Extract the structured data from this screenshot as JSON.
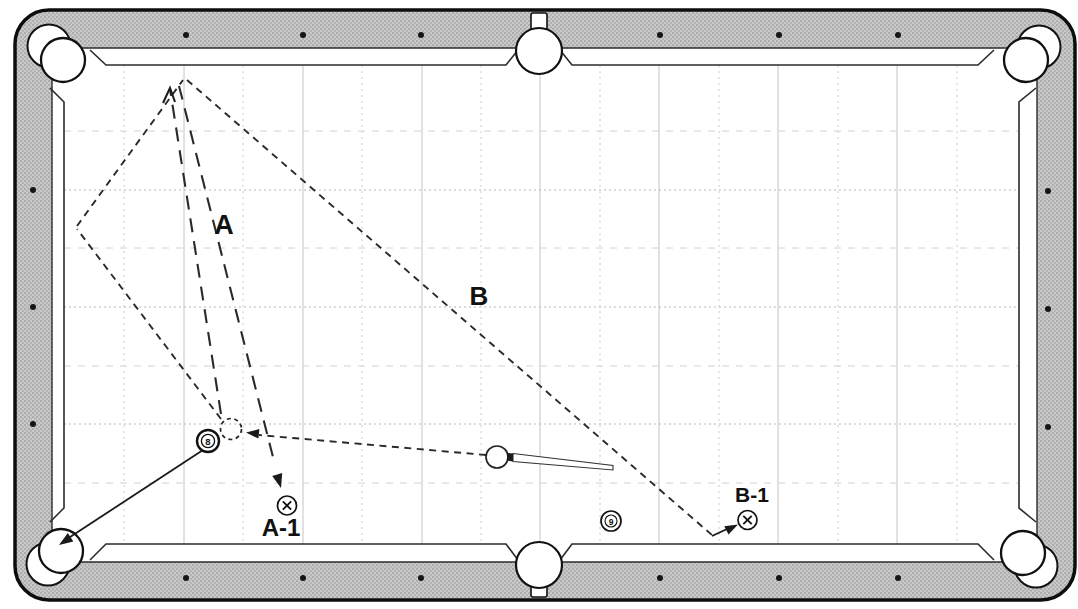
{
  "figure_title": "pool-table-bank-shot-position-diagram",
  "colors": {
    "rail_gray": "#c9c9c9",
    "rail_stipple_dot": "#7d7d7d",
    "frame_outline": "#0d0d0d",
    "cushion_line": "#2b2b2b",
    "grid_major": "#c4c4c4",
    "grid_minor": "#d4d4d4",
    "path_ink": "#2a2a2a",
    "field": "#ffffff"
  },
  "summary": {
    "paths": [
      {
        "label": "A",
        "style": "long-dash",
        "meaning": "cue ball to top cushion and back to position A-1"
      },
      {
        "label": "B",
        "style": "short-dash",
        "meaning": "cue ball two rails (left cushion, top cushion) down table to position B-1"
      }
    ],
    "balls": [
      "8",
      "9",
      "cue"
    ],
    "position_markers": [
      "A-1",
      "B-1"
    ]
  },
  "figure": {
    "width": 1078,
    "height": 609,
    "layers": [
      {
        "t": "rect",
        "n": "table-frame",
        "x": 15,
        "y": 10,
        "w": 1060,
        "h": 590,
        "rx": 34,
        "fill": "url(#stipple)",
        "stroke": "#0d0d0d",
        "sw": 3.5
      },
      {
        "t": "rect",
        "n": "cushion-band",
        "x": 52,
        "y": 48,
        "w": 985,
        "h": 514,
        "rx": 6,
        "fill": "#ffffff",
        "stroke": "#2b2b2b",
        "sw": 1.4
      },
      {
        "t": "vlines",
        "n": "grid-vertical-major",
        "xs": [
          184,
          303,
          422,
          540,
          659,
          778,
          897
        ],
        "y1": 65,
        "y2": 544,
        "stroke": "#c4c4c4",
        "sw": 1
      },
      {
        "t": "vlines",
        "n": "grid-vertical-minor",
        "xs": [
          124,
          243,
          362,
          481,
          600,
          719,
          838,
          957
        ],
        "y1": 65,
        "y2": 544,
        "stroke": "#cccccc",
        "sw": 1,
        "dash": "2,4"
      },
      {
        "t": "hlines",
        "n": "grid-horizontal-major",
        "ys": [
          190,
          307,
          424
        ],
        "x1": 64,
        "x2": 1019,
        "stroke": "#b5b5b5",
        "sw": 1,
        "dash": "2,3"
      },
      {
        "t": "hlines",
        "n": "grid-horizontal-minor",
        "ys": [
          131,
          248,
          366,
          483
        ],
        "x1": 64,
        "x2": 1019,
        "stroke": "#d2d2d2",
        "sw": 1,
        "dash": "7,7"
      },
      {
        "t": "polyline",
        "n": "cushion-nose-top-left",
        "pts": "90,50 106,65 506,65 518,50",
        "stroke": "#2b2b2b",
        "sw": 1.6
      },
      {
        "t": "polyline",
        "n": "cushion-nose-top-right",
        "pts": "560,50 572,65 978,65 994,50",
        "stroke": "#2b2b2b",
        "sw": 1.6
      },
      {
        "t": "polyline",
        "n": "cushion-nose-bottom-left",
        "pts": "90,560 106,544 506,544 518,560",
        "stroke": "#2b2b2b",
        "sw": 1.6
      },
      {
        "t": "polyline",
        "n": "cushion-nose-bottom-right",
        "pts": "560,560 572,544 978,544 994,560",
        "stroke": "#2b2b2b",
        "sw": 1.6
      },
      {
        "t": "polyline",
        "n": "cushion-nose-left",
        "pts": "50,88 64,102 64,508 50,522",
        "stroke": "#2b2b2b",
        "sw": 1.6
      },
      {
        "t": "polyline",
        "n": "cushion-nose-right",
        "pts": "1036,88 1019,102 1019,508 1036,522",
        "stroke": "#2b2b2b",
        "sw": 1.6
      },
      {
        "t": "rect",
        "n": "side-pocket-top-tab",
        "x": 531,
        "y": 13,
        "w": 16,
        "h": 22,
        "rx": 2,
        "fill": "#ffffff",
        "stroke": "#111111",
        "sw": 1.6
      },
      {
        "t": "rect",
        "n": "side-pocket-bottom-tab",
        "x": 531,
        "y": 575,
        "w": 16,
        "h": 22,
        "rx": 2,
        "fill": "#ffffff",
        "stroke": "#111111",
        "sw": 1.6
      },
      {
        "t": "circle",
        "n": "corner-pocket-top-left-lip",
        "cx": 49,
        "cy": 46,
        "r": 21.5,
        "fill": "#ffffff",
        "stroke": "#111111",
        "sw": 2
      },
      {
        "t": "circle",
        "n": "corner-pocket-top-left",
        "cx": 63,
        "cy": 60,
        "r": 22,
        "fill": "#ffffff",
        "stroke": "#111111",
        "sw": 2.3
      },
      {
        "t": "circle",
        "n": "corner-pocket-top-right-lip",
        "cx": 1039,
        "cy": 47,
        "r": 21.5,
        "fill": "#ffffff",
        "stroke": "#111111",
        "sw": 2
      },
      {
        "t": "circle",
        "n": "corner-pocket-top-right",
        "cx": 1026,
        "cy": 60,
        "r": 22,
        "fill": "#ffffff",
        "stroke": "#111111",
        "sw": 2.3
      },
      {
        "t": "circle",
        "n": "corner-pocket-bottom-left-lip",
        "cx": 48,
        "cy": 564,
        "r": 21.5,
        "fill": "#ffffff",
        "stroke": "#111111",
        "sw": 2
      },
      {
        "t": "circle",
        "n": "corner-pocket-bottom-left",
        "cx": 61,
        "cy": 551,
        "r": 22,
        "fill": "#ffffff",
        "stroke": "#111111",
        "sw": 2.3
      },
      {
        "t": "circle",
        "n": "corner-pocket-bottom-right-lip",
        "cx": 1036,
        "cy": 566,
        "r": 21.5,
        "fill": "#ffffff",
        "stroke": "#111111",
        "sw": 2
      },
      {
        "t": "circle",
        "n": "corner-pocket-bottom-right",
        "cx": 1023,
        "cy": 553,
        "r": 22,
        "fill": "#ffffff",
        "stroke": "#111111",
        "sw": 2.3
      },
      {
        "t": "circle",
        "n": "side-pocket-top",
        "cx": 539,
        "cy": 51,
        "r": 23,
        "fill": "#ffffff",
        "stroke": "#111111",
        "sw": 2.2
      },
      {
        "t": "circle",
        "n": "side-pocket-bottom",
        "cx": 539,
        "cy": 565,
        "r": 23,
        "fill": "#ffffff",
        "stroke": "#111111",
        "sw": 2.2
      },
      {
        "t": "dots",
        "n": "rail-diamonds-top",
        "r": 3,
        "fill": "#151515",
        "pts": [
          [
            186,
            35
          ],
          [
            303,
            35
          ],
          [
            421,
            35
          ],
          [
            660,
            35
          ],
          [
            779,
            35
          ],
          [
            898,
            35
          ]
        ]
      },
      {
        "t": "dots",
        "n": "rail-diamonds-bottom",
        "r": 3,
        "fill": "#151515",
        "pts": [
          [
            186,
            578
          ],
          [
            303,
            578
          ],
          [
            421,
            578
          ],
          [
            660,
            578
          ],
          [
            779,
            578
          ],
          [
            898,
            578
          ]
        ]
      },
      {
        "t": "dots",
        "n": "rail-diamonds-left",
        "r": 3,
        "fill": "#151515",
        "pts": [
          [
            33,
            190
          ],
          [
            33,
            307
          ],
          [
            33,
            424
          ]
        ]
      },
      {
        "t": "dots",
        "n": "rail-diamonds-right",
        "r": 3,
        "fill": "#151515",
        "pts": [
          [
            1048,
            191
          ],
          [
            1048,
            309
          ],
          [
            1048,
            427
          ]
        ]
      },
      {
        "t": "line",
        "n": "path-b-segment-ghost-to-left-cushion",
        "p": [
          221,
          419,
          77,
          229
        ],
        "stroke": "#2a2a2a",
        "sw": 1.9,
        "dash": "7,5.5"
      },
      {
        "t": "line",
        "n": "path-b-segment-left-to-top-cushion",
        "p": [
          77,
          226,
          183,
          80
        ],
        "stroke": "#2a2a2a",
        "sw": 1.9,
        "dash": "7,5.5"
      },
      {
        "t": "line",
        "n": "path-b-segment-top-cushion-down-table",
        "p": [
          187,
          80,
          712,
          535
        ],
        "stroke": "#2a2a2a",
        "sw": 1.9,
        "dash": "7,5.5"
      },
      {
        "t": "line",
        "n": "path-b-arrow-shaft",
        "p": [
          712,
          536,
          727,
          529
        ],
        "stroke": "#1a1a1a",
        "sw": 1.9
      },
      {
        "t": "polygon",
        "n": "path-b-arrowhead",
        "pts": "738,524.5 728.5,534.4 724.3,526.2",
        "fill": "#1a1a1a"
      },
      {
        "t": "line",
        "n": "path-a-up-to-top-cushion",
        "p": [
          221,
          414,
          170,
          89
        ],
        "stroke": "#2a2a2a",
        "sw": 2.1,
        "dash": "14,9"
      },
      {
        "t": "polyline",
        "n": "path-a-direction-caret",
        "pts": "163,103 170,88 175,102",
        "stroke": "#1a1a1a",
        "sw": 2
      },
      {
        "t": "line",
        "n": "path-a-down-to-a1",
        "p": [
          179,
          86,
          275,
          465
        ],
        "stroke": "#2a2a2a",
        "sw": 2.1,
        "dash": "14,9"
      },
      {
        "t": "polygon",
        "n": "path-a-arrowhead",
        "pts": "281,488 272.2,475.9 282.2,473.1",
        "fill": "#1a1a1a"
      },
      {
        "t": "line",
        "n": "cue-ball-aim-line",
        "p": [
          486,
          455,
          259,
          435
        ],
        "stroke": "#2a2a2a",
        "sw": 1.9,
        "dash": "7,5.5"
      },
      {
        "t": "polygon",
        "n": "cue-aim-arrowhead",
        "pts": "246,432.5 259.4,429 258.4,438.6",
        "fill": "#1a1a1a"
      },
      {
        "t": "line",
        "n": "eight-ball-to-pocket-line",
        "p": [
          203,
          450,
          64,
          541
        ],
        "stroke": "#1a1a1a",
        "sw": 1.8
      },
      {
        "t": "polygon",
        "n": "eight-ball-pocket-arrowhead",
        "pts": "59,545 67.8,533.1 73.4,541.4",
        "fill": "#1a1a1a"
      },
      {
        "t": "circle",
        "n": "ghost-ball-contact-circle",
        "cx": 231,
        "cy": 429,
        "r": 10.5,
        "stroke": "#222222",
        "sw": 1.7,
        "dash": "4,3.5"
      },
      {
        "t": "circle",
        "n": "eight-ball",
        "cx": 208,
        "cy": 441,
        "r": 11,
        "fill": "#ffffff",
        "stroke": "#111111",
        "sw": 2.4
      },
      {
        "t": "circle",
        "n": "eight-ball-number-ring",
        "cx": 208,
        "cy": 441,
        "r": 6.6,
        "stroke": "#111111",
        "sw": 1.3
      },
      {
        "t": "text",
        "n": "eight-ball-number",
        "x": 208,
        "y": 441.5,
        "fs": 9.5,
        "fw": 700,
        "text": "8"
      },
      {
        "t": "circle",
        "n": "cue-ball",
        "cx": 497,
        "cy": 457,
        "r": 11,
        "fill": "#ffffff",
        "stroke": "#222222",
        "sw": 1.7
      },
      {
        "t": "polygon",
        "n": "cue-stick-shaft",
        "pts": "513,453.5 613,465.5 613,470 513,461.5",
        "fill": "#ffffff",
        "stroke": "#333333",
        "sw": 1.1
      },
      {
        "t": "polygon",
        "n": "cue-stick-tip",
        "pts": "507,452.8 513,453.5 513,461.5 507,460.6",
        "fill": "#1c1c1c"
      },
      {
        "t": "circle",
        "n": "nine-ball",
        "cx": 611,
        "cy": 521,
        "r": 10,
        "fill": "#ffffff",
        "stroke": "#111111",
        "sw": 1.7
      },
      {
        "t": "circle",
        "n": "nine-ball-number-ring",
        "cx": 611,
        "cy": 521,
        "r": 6,
        "stroke": "#111111",
        "sw": 1.1
      },
      {
        "t": "text",
        "n": "nine-ball-number",
        "x": 611,
        "y": 521.5,
        "fs": 8.5,
        "fw": 700,
        "text": "9"
      },
      {
        "t": "circle",
        "n": "position-marker-a1-circle",
        "cx": 287,
        "cy": 505.5,
        "r": 9.5,
        "fill": "#ffffff",
        "stroke": "#111111",
        "sw": 1.7
      },
      {
        "t": "line",
        "n": "position-marker-a1-x1",
        "p": [
          282.8,
          501.3,
          291.2,
          509.7
        ],
        "stroke": "#111111",
        "sw": 1.8
      },
      {
        "t": "line",
        "n": "position-marker-a1-x2",
        "p": [
          291.2,
          501.3,
          282.8,
          509.7
        ],
        "stroke": "#111111",
        "sw": 1.8
      },
      {
        "t": "circle",
        "n": "position-marker-b1-circle",
        "cx": 747.5,
        "cy": 520,
        "r": 9.5,
        "fill": "#ffffff",
        "stroke": "#111111",
        "sw": 1.7
      },
      {
        "t": "line",
        "n": "position-marker-b1-x1",
        "p": [
          743.3,
          515.8,
          751.7,
          524.2
        ],
        "stroke": "#111111",
        "sw": 1.8
      },
      {
        "t": "line",
        "n": "position-marker-b1-x2",
        "p": [
          751.7,
          515.8,
          743.3,
          524.2
        ],
        "stroke": "#111111",
        "sw": 1.8
      },
      {
        "t": "text",
        "n": "label-path-a",
        "x": 224,
        "y": 225,
        "fs": 27,
        "fw": 700,
        "text": "A"
      },
      {
        "t": "text",
        "n": "label-path-b",
        "x": 479,
        "y": 296,
        "fs": 26,
        "fw": 700,
        "text": "B"
      },
      {
        "t": "text",
        "n": "label-position-a1",
        "x": 281,
        "y": 527,
        "fs": 24,
        "fw": 700,
        "text": "A-1"
      },
      {
        "t": "text",
        "n": "label-position-b1",
        "x": 752,
        "y": 494,
        "fs": 21,
        "fw": 700,
        "text": "B-1"
      }
    ]
  }
}
